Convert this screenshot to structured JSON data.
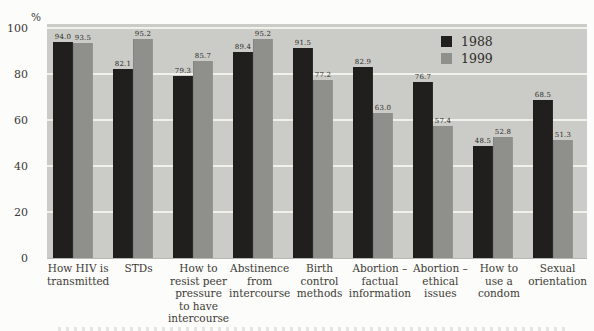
{
  "chart_data": {
    "type": "bar",
    "title": "",
    "ylabel": "%",
    "xlabel": "",
    "ylim": [
      0,
      100
    ],
    "yticks": [
      0,
      20,
      40,
      60,
      80,
      100
    ],
    "grid": true,
    "plot_background": "#cbcbc7",
    "gridline_color": "#f1f1ec",
    "legend_position": "top-right-inside",
    "categories": [
      "How HIV is\ntransmitted",
      "STDs",
      "How to\nresist peer\npressure\nto have\nintercourse",
      "Abstinence\nfrom\nintercourse",
      "Birth\ncontrol\nmethods",
      "Abortion –\nfactual\ninformation",
      "Abortion –\nethical\nissues",
      "How to\nuse a\ncondom",
      "Sexual\norientation"
    ],
    "series": [
      {
        "name": "1988",
        "color": "#201f1d",
        "values": [
          94.0,
          82.1,
          79.3,
          89.4,
          91.5,
          82.9,
          76.7,
          48.5,
          68.5
        ]
      },
      {
        "name": "1999",
        "color": "#8f8f8b",
        "values": [
          93.5,
          95.2,
          85.7,
          95.2,
          77.2,
          63.0,
          57.4,
          52.8,
          51.3
        ]
      }
    ],
    "value_label_decimals": 1
  }
}
